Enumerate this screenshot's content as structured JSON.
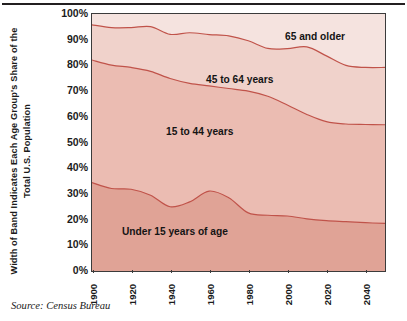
{
  "source_note": "Source: Census Bureau",
  "axes": {
    "y_title": "Width of Band Indicates Each Age Group's Share of the Total U.S. Population",
    "y_ticks": [
      "100%",
      "90%",
      "80%",
      "70%",
      "60%",
      "50%",
      "40%",
      "30%",
      "20%",
      "10%",
      "0%"
    ],
    "x_ticks": [
      "1900",
      "1920",
      "1940",
      "1960",
      "1980",
      "2000",
      "2020",
      "2040"
    ]
  },
  "band_labels": {
    "oldest": "65 and older",
    "middle_older": "45 to 64 years",
    "middle": "15 to 44 years",
    "youngest": "Under 15 years of age"
  },
  "colors": {
    "band_65_plus": "#f5e3df",
    "band_45_64": "#f0d2cb",
    "band_15_44": "#ebbcb2",
    "band_under_15": "#e0a396",
    "band_line": "#c0534a",
    "frame": "#3b3b3b",
    "text": "#1b1b1b"
  },
  "chart_data": {
    "type": "area",
    "title": "",
    "subtitle": "",
    "xlabel": "",
    "ylabel": "Width of Band Indicates Each Age Group's Share of the Total U.S. Population",
    "stacked": true,
    "stack_order": "bottom-to-top",
    "percent_of_total": true,
    "xlim": [
      1900,
      2050
    ],
    "ylim": [
      0,
      100
    ],
    "grid": false,
    "legend": "inline-band-labels",
    "x_tick_labels": [
      "1900",
      "1920",
      "1940",
      "1960",
      "1980",
      "2000",
      "2020",
      "2040"
    ],
    "y_tick_labels": [
      "0%",
      "10%",
      "20%",
      "30%",
      "40%",
      "50%",
      "60%",
      "70%",
      "80%",
      "90%",
      "100%"
    ],
    "x": [
      1900,
      1910,
      1920,
      1930,
      1940,
      1950,
      1960,
      1970,
      1980,
      1990,
      2000,
      2010,
      2020,
      2030,
      2040,
      2050
    ],
    "series": [
      {
        "name": "Under 15 years of age",
        "color": "#e0a396",
        "values": [
          34.4,
          32.1,
          31.8,
          29.5,
          25.0,
          26.9,
          31.1,
          28.5,
          22.6,
          21.7,
          21.4,
          20.3,
          19.6,
          19.2,
          18.8,
          18.5
        ]
      },
      {
        "name": "15 to 44 years",
        "color": "#ebbcb2",
        "values": [
          47.7,
          48.0,
          47.4,
          48.2,
          49.9,
          46.1,
          40.9,
          42.5,
          47.4,
          46.3,
          43.2,
          40.6,
          38.5,
          38.0,
          38.2,
          38.4
        ]
      },
      {
        "name": "45 to 64 years",
        "color": "#f0d2cb",
        "values": [
          13.7,
          14.6,
          15.5,
          17.4,
          17.2,
          19.7,
          20.0,
          20.5,
          19.6,
          18.6,
          21.9,
          26.3,
          25.6,
          22.8,
          22.2,
          22.3
        ]
      },
      {
        "name": "65 and older",
        "color": "#f5e3df",
        "values": [
          4.2,
          5.3,
          5.3,
          4.9,
          7.9,
          7.3,
          8.0,
          8.5,
          10.4,
          13.4,
          13.5,
          12.8,
          16.3,
          20.0,
          20.8,
          20.8
        ]
      }
    ],
    "cumulative_boundaries": {
      "note": "Upper boundary of each stacked band, in percent of total population",
      "under_15_top": [
        34.4,
        32.1,
        31.8,
        29.5,
        25.0,
        26.9,
        31.1,
        28.5,
        22.6,
        21.7,
        21.4,
        20.3,
        19.6,
        19.2,
        18.8,
        18.5
      ],
      "15_44_top": [
        82.1,
        80.1,
        79.2,
        77.7,
        74.9,
        73.0,
        72.0,
        71.0,
        70.0,
        68.0,
        64.6,
        60.9,
        58.1,
        57.2,
        57.0,
        56.9
      ],
      "45_64_top": [
        95.8,
        94.7,
        94.7,
        95.1,
        92.1,
        92.7,
        92.0,
        91.5,
        89.6,
        86.6,
        86.5,
        87.2,
        83.7,
        80.0,
        79.2,
        79.2
      ],
      "65_plus_top": [
        100,
        100,
        100,
        100,
        100,
        100,
        100,
        100,
        100,
        100,
        100,
        100,
        100,
        100,
        100,
        100
      ]
    }
  }
}
